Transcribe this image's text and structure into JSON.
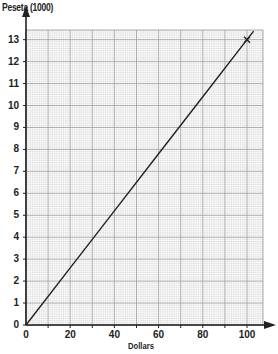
{
  "chart_data": {
    "type": "line",
    "title": "",
    "xlabel": "Dollars",
    "ylabel": "Peseta (1000)",
    "xlim": [
      0,
      105
    ],
    "ylim": [
      0,
      13.3
    ],
    "xticks": [
      0,
      20,
      40,
      60,
      80,
      100
    ],
    "yticks": [
      0,
      1,
      2,
      3,
      4,
      5,
      6,
      7,
      8,
      9,
      10,
      11,
      12,
      13
    ],
    "grid": true,
    "legend": null,
    "series": [
      {
        "name": "Conversion line",
        "x": [
          0,
          20,
          40,
          60,
          80,
          100,
          103
        ],
        "values": [
          0,
          2.6,
          5.2,
          7.8,
          10.4,
          13,
          13.39
        ],
        "color": "#222222"
      }
    ],
    "annotations": [
      {
        "type": "cross-marker",
        "x": 100,
        "y": 13
      }
    ]
  },
  "labels": {
    "y_title": "Peseta (1000)",
    "x_title": "Dollars"
  },
  "colors": {
    "axis": "#222222",
    "grid_major": "#9a9a9a",
    "grid_minor": "#cfcfcf",
    "line": "#222222"
  }
}
